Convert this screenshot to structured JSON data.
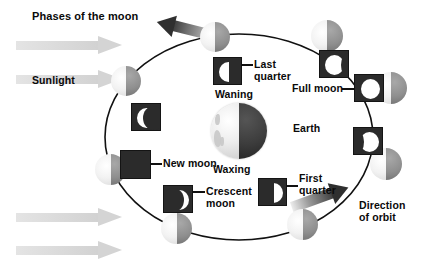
{
  "diagram": {
    "title": "Phases of the moon",
    "labels": {
      "sunlight": "Sunlight",
      "earth": "Earth",
      "waning": "Waning",
      "waxing": "Waxing",
      "new_moon": "New moon",
      "full_moon": "Full moon",
      "last_quarter_l1": "Last",
      "last_quarter_l2": "quarter",
      "first_quarter_l1": "First",
      "first_quarter_l2": "quarter",
      "crescent_l1": "Crescent",
      "crescent_l2": "moon",
      "direction_l1": "Direction",
      "direction_l2": "of orbit"
    },
    "colors": {
      "text": "#0a0a0a",
      "orbit_line": "#111111",
      "moon_lit": "#f4f4f4",
      "moon_dark": "#8f8f8f",
      "inset_bg": "#2b2b2b",
      "inset_disc": "#ffffff",
      "sun_arrow": "#d8d8d8",
      "earth_lit": "#ededed",
      "earth_dark": "#303030"
    },
    "orbit": {
      "center_x": 239,
      "center_y": 137,
      "radius_x": 134,
      "radius_y": 103
    },
    "moon_positions": [
      {
        "name": "moon-left-upper",
        "x": 111,
        "y": 66,
        "size": 30
      },
      {
        "name": "moon-top-left",
        "x": 200,
        "y": 22,
        "size": 30
      },
      {
        "name": "moon-top-right",
        "x": 311,
        "y": 20,
        "size": 32
      },
      {
        "name": "moon-right-upper",
        "x": 375,
        "y": 72,
        "size": 32
      },
      {
        "name": "moon-right-lower",
        "x": 370,
        "y": 148,
        "size": 32
      },
      {
        "name": "moon-bottom-right",
        "x": 287,
        "y": 209,
        "size": 31
      },
      {
        "name": "moon-bottom-left",
        "x": 161,
        "y": 213,
        "size": 31
      },
      {
        "name": "moon-left-lower",
        "x": 95,
        "y": 154,
        "size": 31
      }
    ],
    "insets": [
      {
        "name": "inset-waning-crescent",
        "phase": "waning-crescent",
        "x": 131,
        "y": 103,
        "w": 30,
        "h": 28
      },
      {
        "name": "inset-last-quarter",
        "phase": "last-quarter",
        "x": 213,
        "y": 57,
        "w": 29,
        "h": 28
      },
      {
        "name": "inset-waning-gibbous",
        "phase": "waning-gibbous",
        "x": 319,
        "y": 50,
        "w": 30,
        "h": 28
      },
      {
        "name": "inset-full-moon",
        "phase": "full-moon",
        "x": 354,
        "y": 74,
        "w": 30,
        "h": 28
      },
      {
        "name": "inset-waxing-gibbous",
        "phase": "waxing-gibbous",
        "x": 353,
        "y": 127,
        "w": 30,
        "h": 28
      },
      {
        "name": "inset-first-quarter",
        "phase": "first-quarter",
        "x": 258,
        "y": 178,
        "w": 29,
        "h": 28
      },
      {
        "name": "inset-waxing-crescent",
        "phase": "waxing-crescent",
        "x": 163,
        "y": 185,
        "w": 30,
        "h": 28
      },
      {
        "name": "inset-new-moon",
        "phase": "new-moon",
        "x": 120,
        "y": 150,
        "w": 31,
        "h": 29
      }
    ],
    "sun_arrows": [
      {
        "name": "sunlight-arrow-1",
        "x": 16,
        "y": 36,
        "w": 106,
        "h": 19
      },
      {
        "name": "sunlight-arrow-2",
        "x": 16,
        "y": 70,
        "w": 106,
        "h": 19
      },
      {
        "name": "sunlight-arrow-3",
        "x": 16,
        "y": 208,
        "w": 106,
        "h": 19
      },
      {
        "name": "sunlight-arrow-4",
        "x": 16,
        "y": 241,
        "w": 106,
        "h": 19
      }
    ]
  }
}
